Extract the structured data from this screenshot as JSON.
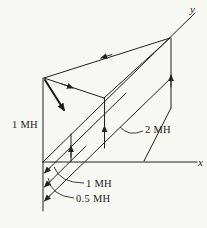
{
  "figure": {
    "colors": {
      "background": "#f7f7f4",
      "ink": "#222222"
    },
    "axes": {
      "x_label": "x",
      "y_label": "y"
    },
    "labels": {
      "left_inductor": "1 MH",
      "right_inductor": "2 MH",
      "middle_inductor": "1 MH",
      "bottom_inductor": "0.5 MH"
    }
  }
}
